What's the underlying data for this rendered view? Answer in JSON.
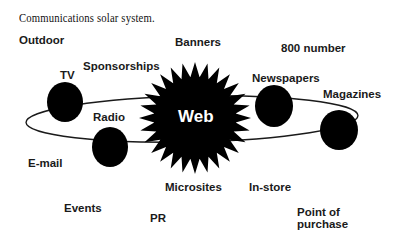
{
  "title": "Communications solar system.",
  "sun": {
    "label": "Web",
    "color": "#000000"
  },
  "planets": [
    {
      "label": "TV"
    },
    {
      "label": "Radio"
    },
    {
      "label": "Newspapers"
    },
    {
      "label": "Magazines"
    }
  ],
  "floating_labels": {
    "outdoor": "Outdoor",
    "banners": "Banners",
    "number800": "800 number",
    "sponsorships": "Sponsorships",
    "email": "E-mail",
    "microsites": "Microsites",
    "instore": "In-store",
    "events": "Events",
    "pr": "PR",
    "pop_line1": "Point of",
    "pop_line2": "purchase"
  }
}
